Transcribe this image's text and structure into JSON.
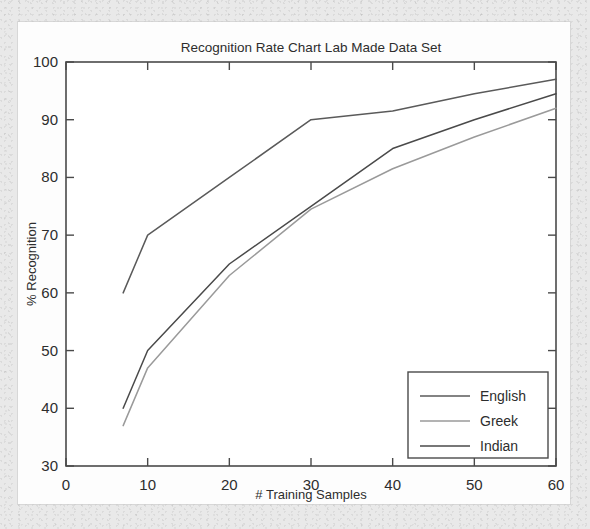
{
  "chart_data": {
    "type": "line",
    "title": "Recognition Rate Chart Lab Made Data Set",
    "xlabel": "# Training Samples",
    "ylabel": "% Recognition",
    "xlim": [
      0,
      60
    ],
    "ylim": [
      30,
      100
    ],
    "xticks": [
      0,
      10,
      20,
      30,
      40,
      50,
      60
    ],
    "yticks": [
      30,
      40,
      50,
      60,
      70,
      80,
      90,
      100
    ],
    "xtick_labels": [
      "0",
      "10",
      "20",
      "30",
      "40",
      "50",
      "60"
    ],
    "ytick_labels": [
      "30",
      "40",
      "50",
      "60",
      "70",
      "80",
      "90",
      "100"
    ],
    "grid": false,
    "legend_position": "lower right",
    "series": [
      {
        "name": "English",
        "color": "#5a5a5a",
        "x": [
          7,
          10,
          20,
          30,
          40,
          50,
          60
        ],
        "y": [
          60,
          70,
          80,
          90,
          91.5,
          94.5,
          97
        ]
      },
      {
        "name": "Greek",
        "color": "#9a9a9a",
        "x": [
          7,
          10,
          20,
          30,
          40,
          50,
          60
        ],
        "y": [
          37,
          47,
          63,
          74.5,
          81.5,
          87,
          92
        ]
      },
      {
        "name": "Indian",
        "color": "#4a4a4a",
        "x": [
          7,
          10,
          20,
          30,
          40,
          50,
          60
        ],
        "y": [
          40,
          50,
          65,
          75,
          85,
          90,
          94.5
        ]
      }
    ]
  },
  "legend": {
    "entries": [
      {
        "label": "English"
      },
      {
        "label": "Greek"
      },
      {
        "label": "Indian"
      }
    ]
  }
}
